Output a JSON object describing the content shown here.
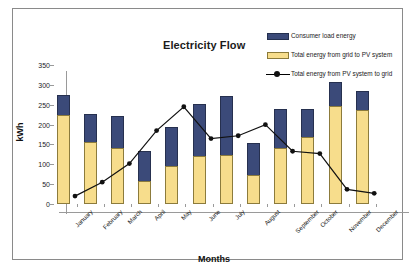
{
  "chart_data": {
    "type": "bar",
    "title": "Electricity Flow",
    "xlabel": "Months",
    "ylabel": "kWh",
    "ylim": [
      0,
      350
    ],
    "ytick_step": 50,
    "yticks": [
      0,
      50,
      100,
      150,
      200,
      250,
      300,
      350
    ],
    "grid": false,
    "legend_position": "top-right",
    "categories": [
      "January",
      "February",
      "March",
      "April",
      "May",
      "June",
      "July",
      "August",
      "September",
      "October",
      "November",
      "December"
    ],
    "series": [
      {
        "name": "Consumer load energy",
        "type": "bar",
        "color": "#3b4a79",
        "values": [
          274,
          227,
          222,
          133,
          193,
          253,
          271,
          154,
          238,
          240,
          306,
          284
        ]
      },
      {
        "name": "Total energy from grid to PV system",
        "type": "bar",
        "color": "#f7dd8c",
        "values": [
          225,
          157,
          140,
          58,
          95,
          122,
          124,
          72,
          142,
          168,
          247,
          236
        ]
      },
      {
        "name": "Total energy from PV system to grid",
        "type": "line",
        "color": "#111111",
        "values": [
          40,
          75,
          122,
          205,
          265,
          185,
          192,
          220,
          153,
          147,
          57,
          47
        ]
      }
    ]
  },
  "legend": {
    "items": [
      {
        "label": "Consumer load energy",
        "key": "bar-blue"
      },
      {
        "label": "Total energy from grid to PV system",
        "key": "bar-yellow"
      },
      {
        "label": "Total energy from PV system to grid",
        "key": "line-marker"
      }
    ]
  }
}
